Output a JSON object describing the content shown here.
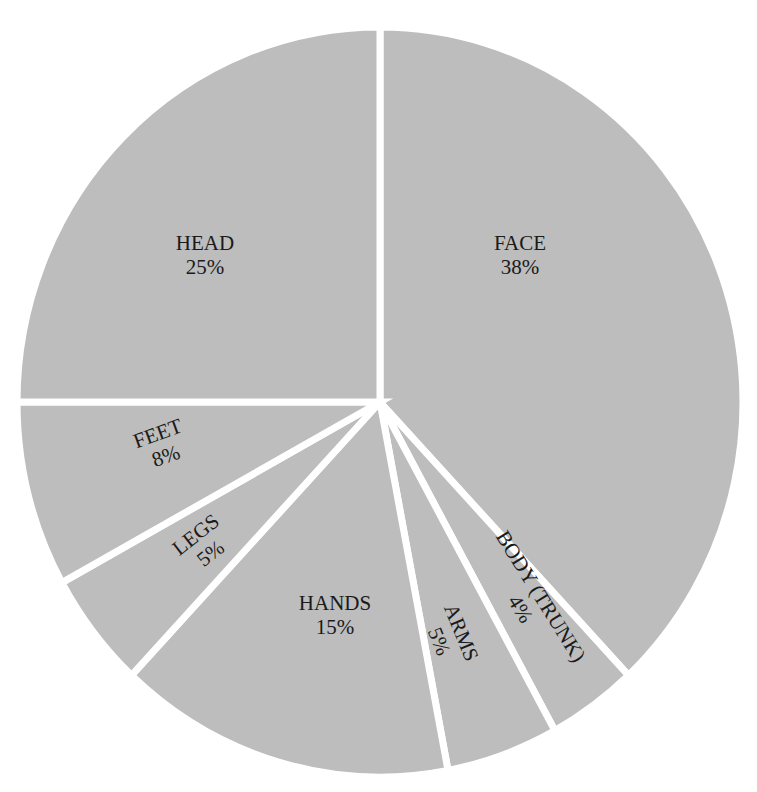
{
  "chart_data": {
    "type": "pie",
    "title": "",
    "title_partially_visible": true,
    "categories": [
      "FACE",
      "BODY (TRUNK)",
      "ARMS",
      "HANDS",
      "LEGS",
      "FEET",
      "HEAD"
    ],
    "values": [
      38,
      4,
      5,
      15,
      5,
      8,
      25
    ],
    "unit": "%",
    "start_angle_deg": 0,
    "direction": "clockwise",
    "fill_color": "#bdbdbd",
    "separator_color": "#ffffff",
    "legend": "none",
    "labels": [
      {
        "name": "FACE",
        "pct": "38%",
        "x": 520,
        "y": 250,
        "rot": 0
      },
      {
        "name": "BODY (TRUNK)",
        "pct": "4%",
        "x": 535,
        "y": 600,
        "rot": 58
      },
      {
        "name": "ARMS",
        "pct": "5%",
        "x": 455,
        "y": 635,
        "rot": 68
      },
      {
        "name": "HANDS",
        "pct": "15%",
        "x": 335,
        "y": 610,
        "rot": 0
      },
      {
        "name": "LEGS",
        "pct": "5%",
        "x": 200,
        "y": 540,
        "rot": -38
      },
      {
        "name": "FEET",
        "pct": "8%",
        "x": 160,
        "y": 440,
        "rot": -20
      },
      {
        "name": "HEAD",
        "pct": "25%",
        "x": 205,
        "y": 250,
        "rot": 0
      }
    ]
  }
}
